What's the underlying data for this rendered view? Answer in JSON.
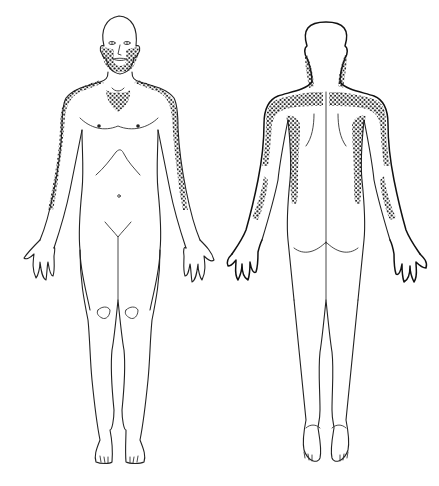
{
  "figure": {
    "type": "body-map",
    "views": [
      {
        "id": "anterior",
        "label": "Front view",
        "shaded_regions": [
          "face-beard-area",
          "upper-chest-v",
          "right-shoulder-lateral-arm",
          "left-shoulder-lateral-arm"
        ]
      },
      {
        "id": "posterior",
        "label": "Back view",
        "shaded_regions": [
          "neck-sides",
          "upper-back-shoulders",
          "right-scapular-strip",
          "left-scapular-strip",
          "right-posterior-arm",
          "left-posterior-arm",
          "right-posterior-forearm",
          "left-posterior-forearm"
        ]
      }
    ],
    "colors": {
      "background": "#ffffff",
      "line": "#222222",
      "stipple": "#1a1a1a"
    }
  }
}
